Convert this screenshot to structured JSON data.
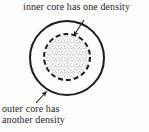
{
  "figure": {
    "width": 149,
    "height": 132,
    "background_color": "#fdfdfc",
    "line_color": "#1b1b1b",
    "stipple_color": "#8f8f8f"
  },
  "labels": {
    "inner": {
      "text": "inner core has one density",
      "icon": "arrow-down-left-icon"
    },
    "outer": {
      "line1": "outer core has",
      "line2": "another density",
      "icon": "arrow-up-right-icon"
    }
  },
  "shapes": {
    "outer_circle": {
      "name": "outer core boundary",
      "cx": 67,
      "cy": 58,
      "r": 37,
      "stroke": "#1b1b1b",
      "stroke_width": 2,
      "dash": "none",
      "fill": "none"
    },
    "inner_circle": {
      "name": "inner core boundary",
      "cx": 67,
      "cy": 57,
      "r": 23,
      "stroke": "#1b1b1b",
      "stroke_width": 2,
      "dash": "5 3",
      "fill": "stipple"
    }
  },
  "annotations": {
    "inner_arrow": {
      "from_x": 84,
      "from_y": 20,
      "to_x": 73,
      "to_y": 37
    },
    "outer_arrow": {
      "from_x": 36,
      "from_y": 104,
      "to_x": 47,
      "to_y": 91
    }
  }
}
